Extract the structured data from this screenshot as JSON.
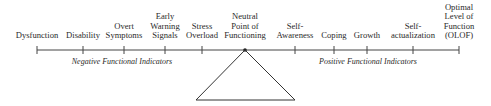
{
  "diagram": {
    "scale_points": [
      {
        "label": "Dysfunction",
        "x": 37,
        "lines": 1
      },
      {
        "label": "Disability",
        "x": 83,
        "lines": 1
      },
      {
        "label": "Overt\nSymptoms",
        "x": 124,
        "lines": 2
      },
      {
        "label": "Early\nWarning\nSignals",
        "x": 165,
        "lines": 3
      },
      {
        "label": "Stress\nOverload",
        "x": 202,
        "lines": 2
      },
      {
        "label": "Neutral\nPoint of\nFunctioning",
        "x": 245,
        "lines": 3
      },
      {
        "label": "Self-\nAwareness",
        "x": 295,
        "lines": 2
      },
      {
        "label": "Coping",
        "x": 334,
        "lines": 1
      },
      {
        "label": "Growth",
        "x": 367,
        "lines": 1
      },
      {
        "label": "Self-\nactualization",
        "x": 413,
        "lines": 2
      },
      {
        "label": "Optimal\nLevel of\nFunction\n(OLOF)",
        "x": 459,
        "lines": 4
      }
    ],
    "negative_label": "Negative Functional Indicators",
    "positive_label": "Positive Functional Indicators"
  }
}
